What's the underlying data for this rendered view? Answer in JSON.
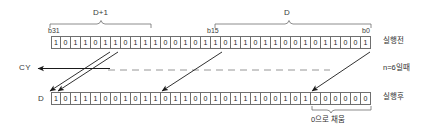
{
  "diagram": {
    "group_labels": {
      "high_word": "D+1",
      "low_word": "D"
    },
    "bit_labels": {
      "msb": "b31",
      "mid": "b15",
      "lsb": "b0"
    },
    "carry_label": "CY",
    "dest_label": "D",
    "shift_note": "n=6일때",
    "before_label": "실행전",
    "after_label": "실행후",
    "fill_note": "0으로 채움",
    "before_bits": [
      "1",
      "0",
      "1",
      "1",
      "0",
      "1",
      "1",
      "0",
      "1",
      "1",
      "1",
      "0",
      "0",
      "1",
      "0",
      "1",
      "1",
      "0",
      "1",
      "1",
      "0",
      "1",
      "1",
      "0",
      "0",
      "1",
      "0",
      "1",
      "1",
      "0",
      "0",
      "1"
    ],
    "after_bits": [
      "1",
      "0",
      "1",
      "1",
      "1",
      "0",
      "0",
      "1",
      "0",
      "1",
      "1",
      "0",
      "1",
      "1",
      "0",
      "0",
      "1",
      "0",
      "1",
      "1",
      "1",
      "0",
      "0",
      "1",
      "0",
      "1",
      "0",
      "0",
      "0",
      "0",
      "0",
      "0"
    ],
    "fill_zero_count": 6,
    "shift_amount": 6,
    "colors": {
      "ink": "#2a2a2a",
      "cell_border": "#6f6f6f",
      "arrow": "#1a1a1a",
      "brace": "#6f6f6f",
      "dashed": "#8a8a8a",
      "background": "#ffffff"
    }
  }
}
